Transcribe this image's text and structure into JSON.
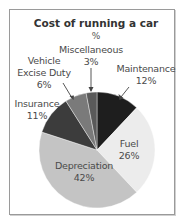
{
  "chart_data": {
    "type": "pie",
    "title": "Cost of running a car",
    "subtitle": "%",
    "start": "12 o'clock",
    "direction": "clockwise",
    "slices": [
      {
        "label": "Maintenance",
        "value": 12,
        "display": "12%",
        "color": "#1e1e1e",
        "label_placement": "outside-arrow"
      },
      {
        "label": "Fuel",
        "value": 26,
        "display": "26%",
        "color": "#ececec",
        "label_placement": "inside"
      },
      {
        "label": "Depreciation",
        "value": 42,
        "display": "42%",
        "color": "#c4c4c4",
        "label_placement": "inside"
      },
      {
        "label": "Insurance",
        "value": 11,
        "display": "11%",
        "color": "#3c3c3c",
        "label_placement": "outside"
      },
      {
        "label": "Vehicle Excise Duty",
        "value": 6,
        "display": "6%",
        "color": "#7a7a7a",
        "label_placement": "outside-arrow"
      },
      {
        "label": "Miscellaneous",
        "value": 3,
        "display": "3%",
        "color": "#5a5a5a",
        "label_placement": "outside-arrow"
      }
    ]
  },
  "labels": {
    "maintenance": {
      "name": "Maintenance",
      "pct": "12%"
    },
    "fuel": {
      "name": "Fuel",
      "pct": "26%"
    },
    "depreciation": {
      "name": "Depreciation",
      "pct": "42%"
    },
    "insurance": {
      "name": "Insurance",
      "pct": "11%"
    },
    "ved": {
      "line1": "Vehicle",
      "line2": "Excise Duty",
      "pct": "6%"
    },
    "misc": {
      "name": "Miscellaneous",
      "pct": "3%"
    }
  }
}
